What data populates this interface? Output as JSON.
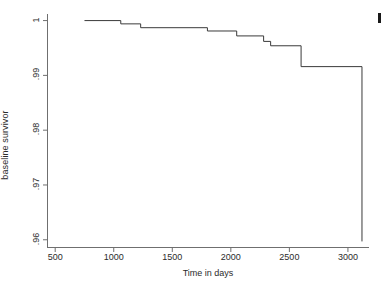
{
  "chart_data": {
    "type": "line",
    "subtype": "step-function",
    "title": "",
    "xlabel": "Time in days",
    "ylabel": "baseline survivor",
    "xlim": [
      430,
      3180
    ],
    "ylim": [
      0.9585,
      1.0012
    ],
    "grid": false,
    "legend": null,
    "xticks": [
      500,
      1000,
      1500,
      2000,
      2500,
      3000
    ],
    "xtick_labels": [
      "500",
      "1000",
      "1500",
      "2000",
      "2500",
      "3000"
    ],
    "yticks": [
      0.96,
      0.97,
      0.98,
      0.99,
      1.0
    ],
    "ytick_labels": [
      ".96",
      ".97",
      ".98",
      ".99",
      "1"
    ],
    "series": [
      {
        "name": "baseline survivor",
        "color": "#3a3a3a",
        "line_width": 1.0,
        "x": [
          750,
          1060,
          1060,
          1230,
          1230,
          1800,
          1800,
          2050,
          2050,
          2280,
          2280,
          2340,
          2340,
          2600,
          2600,
          3120,
          3120
        ],
        "y": [
          1.0,
          1.0,
          0.9994,
          0.9994,
          0.9987,
          0.9987,
          0.9981,
          0.9981,
          0.9972,
          0.9972,
          0.9962,
          0.9962,
          0.9954,
          0.9954,
          0.9916,
          0.9916,
          0.9597
        ]
      }
    ],
    "steps": [
      {
        "time": 750,
        "survival": 1.0
      },
      {
        "time": 1060,
        "survival": 0.9994
      },
      {
        "time": 1230,
        "survival": 0.9987
      },
      {
        "time": 1800,
        "survival": 0.9981
      },
      {
        "time": 2050,
        "survival": 0.9972
      },
      {
        "time": 2280,
        "survival": 0.9962
      },
      {
        "time": 2340,
        "survival": 0.9954
      },
      {
        "time": 2600,
        "survival": 0.9916
      },
      {
        "time": 3120,
        "survival": 0.9597
      }
    ]
  },
  "axes": {
    "x_title": "Time in days",
    "y_title": "baseline survivor",
    "spine_color": "#6f6f6f"
  },
  "colors": {
    "background": "#ffffff",
    "curve": "#3a3a3a",
    "axis": "#6f6f6f",
    "text": "#2b2b2b"
  }
}
